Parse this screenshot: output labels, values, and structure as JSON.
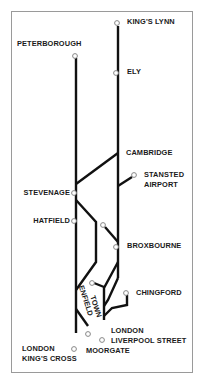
{
  "diagram": {
    "type": "railway-route-map",
    "line_color": "#111111",
    "station_marker_color": "#888888",
    "border_color": "#9a9a9a"
  },
  "stations": {
    "kings_lynn": "KING'S LYNN",
    "peterborough": "PETERBOROUGH",
    "ely": "ELY",
    "cambridge": "CAMBRIDGE",
    "stansted_1": "STANSTED",
    "stansted_2": "AIRPORT",
    "stevenage": "STEVENAGE",
    "hatfield": "HATFIELD",
    "broxbourne": "BROXBOURNE",
    "chingford": "CHINGFORD",
    "enfield_1": "ENFIELD",
    "enfield_2": "TOWN",
    "liverpool_1": "LONDON",
    "liverpool_2": "LIVERPOOL STREET",
    "kings_cross_1": "LONDON",
    "kings_cross_2": "KING'S CROSS",
    "moorgate": "MOORGATE"
  }
}
